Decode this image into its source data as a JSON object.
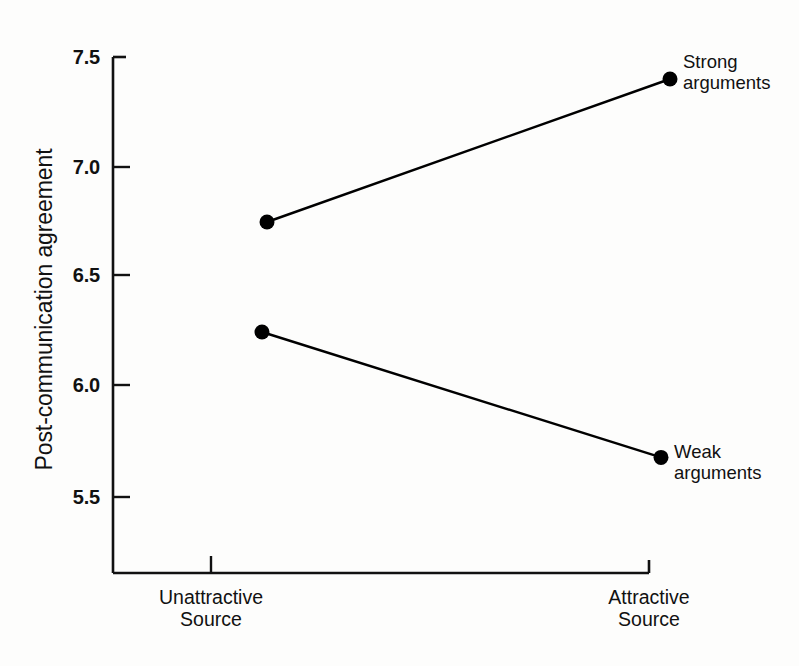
{
  "chart_data": {
    "type": "line",
    "title": "",
    "subtitle": "",
    "xlabel": "",
    "ylabel": "Post-communication agreement",
    "categories": [
      "Unattractive\nSource",
      "Attractive\nSource"
    ],
    "category_labels": [
      {
        "line1": "Unattractive",
        "line2": "Source"
      },
      {
        "line1": "Attractive",
        "line2": "Source"
      }
    ],
    "series": [
      {
        "name": "Strong arguments",
        "label_line1": "Strong",
        "label_line2": "arguments",
        "values": [
          6.75,
          7.4
        ],
        "marker": "filled-circle",
        "color": "#000000"
      },
      {
        "name": "Weak arguments",
        "label_line1": "Weak",
        "label_line2": "arguments",
        "values": [
          6.25,
          5.68
        ],
        "marker": "filled-circle",
        "color": "#000000"
      }
    ],
    "yticks": [
      5.5,
      6.0,
      6.5,
      7.0,
      7.5
    ],
    "ytick_labels": [
      "5.5",
      "6.0",
      "6.5",
      "7.0",
      "7.5"
    ],
    "ylim": [
      5.2,
      7.5
    ],
    "grid": false,
    "legend": "inline-right-of-endpoints",
    "background_color": "#ffffff",
    "line_color": "#000000"
  },
  "axis": {
    "y_tick_0": "5.5",
    "y_tick_1": "6.0",
    "y_tick_2": "6.5",
    "y_tick_3": "7.0",
    "y_tick_4": "7.5",
    "y_title": "Post-communication agreement"
  },
  "x_categories": {
    "left_line1": "Unattractive",
    "left_line2": "Source",
    "right_line1": "Attractive",
    "right_line2": "Source"
  },
  "annotations": {
    "strong_line1": "Strong",
    "strong_line2": "arguments",
    "weak_line1": "Weak",
    "weak_line2": "arguments"
  }
}
